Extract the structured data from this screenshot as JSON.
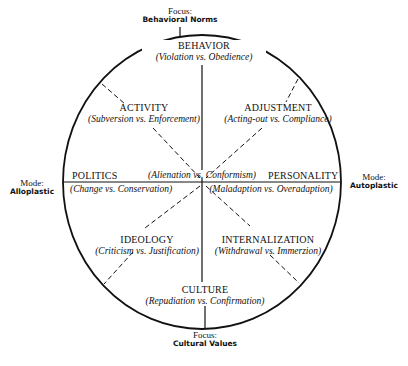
{
  "axes": {
    "top": {
      "head": "Focus:",
      "value": "Behavioral Norms"
    },
    "bottom": {
      "head": "Focus:",
      "value": "Cultural Values"
    },
    "left": {
      "head": "Mode:",
      "value": "Alloplastic"
    },
    "right": {
      "head": "Mode:",
      "value": "Autoplastic"
    }
  },
  "sectors": {
    "behavior": {
      "title": "BEHAVIOR",
      "sub": "(Violation vs. Obedience)"
    },
    "activity": {
      "title": "ACTIVITY",
      "sub": "(Subversion vs. Enforcement)"
    },
    "adjustment": {
      "title": "ADJUSTMENT",
      "sub": "(Acting-out vs. Compliance)"
    },
    "politics": {
      "title": "POLITICS",
      "sub": "(Change vs. Conservation)"
    },
    "center": {
      "sub": "(Alienation vs. Conformism)"
    },
    "personality": {
      "title": "PERSONALITY",
      "sub": "(Maladaption vs. Overadaption)"
    },
    "ideology": {
      "title": "IDEOLOGY",
      "sub": "(Criticism vs. Justification)"
    },
    "internalization": {
      "title": "INTERNALIZATION",
      "sub": "(Withdrawal vs. Immerzion)"
    },
    "culture": {
      "title": "CULTURE",
      "sub": "(Repudiation vs. Confirmation)"
    }
  },
  "colors": {
    "ink": "#111111",
    "background": "#ffffff"
  }
}
